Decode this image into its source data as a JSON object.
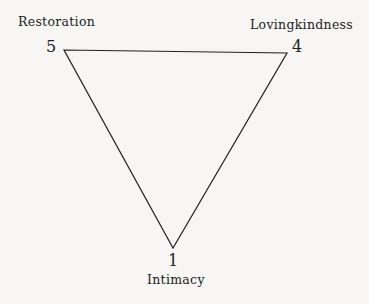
{
  "diagram": {
    "type": "triangle",
    "vertices": [
      {
        "id": "restoration",
        "label": "Restoration",
        "number": "5",
        "x": 64,
        "y": 50
      },
      {
        "id": "lovingkindness",
        "label": "Lovingkindness",
        "number": "4",
        "x": 287,
        "y": 53
      },
      {
        "id": "intimacy",
        "label": "Intimacy",
        "number": "1",
        "x": 173,
        "y": 248
      }
    ],
    "colors": {
      "line": "#222222",
      "background": "#f7f6f4"
    }
  }
}
